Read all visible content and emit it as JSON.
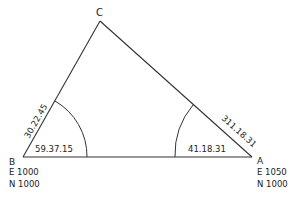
{
  "diagram": {
    "type": "survey-triangle",
    "vertices": {
      "A": {
        "label": "A",
        "easting": "E 1050",
        "northing": "N 1000"
      },
      "B": {
        "label": "B",
        "easting": "E 1000",
        "northing": "N 1000"
      },
      "C": {
        "label": "C"
      }
    },
    "angles": {
      "at_B": "59.37.15",
      "at_A": "41.18.31"
    },
    "bearings": {
      "BC": "30.22.45",
      "AC": "311.18.31"
    },
    "colors": {
      "line": "#333333",
      "text": "#222222",
      "background": "#ffffff"
    }
  }
}
